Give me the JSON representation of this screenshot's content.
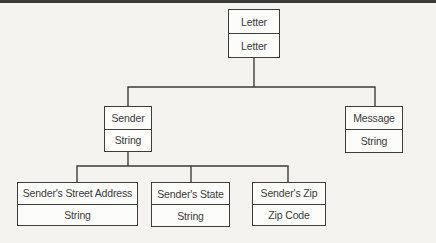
{
  "diagram": {
    "type": "tree",
    "colors": {
      "background": "#f4f3f0",
      "line": "#3d3d3d",
      "box_fill": "#fcfcfa",
      "text": "#3a3a3a",
      "top_rule": "#3a3a3a"
    },
    "nodes": [
      {
        "id": "letter",
        "title": "Letter",
        "subtitle": "Letter"
      },
      {
        "id": "sender",
        "title": "Sender",
        "subtitle": "String"
      },
      {
        "id": "message",
        "title": "Message",
        "subtitle": "String"
      },
      {
        "id": "street",
        "title": "Sender's Street Address",
        "subtitle": "String"
      },
      {
        "id": "state",
        "title": "Sender's State",
        "subtitle": "String"
      },
      {
        "id": "zip",
        "title": "Sender's Zip",
        "subtitle": "Zip Code"
      }
    ],
    "edges": [
      {
        "from": "Letter",
        "to": "Sender"
      },
      {
        "from": "Letter",
        "to": "Message"
      },
      {
        "from": "Sender",
        "to": "Sender's Street Address"
      },
      {
        "from": "Sender",
        "to": "Sender's State"
      },
      {
        "from": "Sender",
        "to": "Sender's Zip"
      }
    ]
  }
}
